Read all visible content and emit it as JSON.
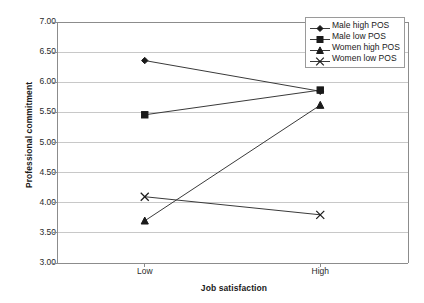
{
  "chart_data": {
    "type": "line",
    "title": "",
    "xlabel": "Job satisfaction",
    "ylabel": "Professional commitment",
    "categories": [
      "Low",
      "High"
    ],
    "ylim": [
      3.0,
      7.0
    ],
    "ytick_step": 0.5,
    "ytick_labels": [
      "7.00",
      "6.50",
      "6.00",
      "5.50",
      "5.00",
      "4.50",
      "4.00",
      "3.50",
      "3.00"
    ],
    "ytick_values": [
      7.0,
      6.5,
      6.0,
      5.5,
      5.0,
      4.5,
      4.0,
      3.5,
      3.0
    ],
    "grid": "horizontal",
    "legend_position": "top-right-inside",
    "series": [
      {
        "name": "Male high POS",
        "marker": "diamond",
        "values": [
          6.36,
          5.85
        ]
      },
      {
        "name": "Male low POS",
        "marker": "square",
        "values": [
          5.46,
          5.87
        ]
      },
      {
        "name": "Women high POS",
        "marker": "triangle",
        "values": [
          3.7,
          5.62
        ]
      },
      {
        "name": "Women low POS",
        "marker": "cross",
        "values": [
          4.1,
          3.8
        ]
      }
    ],
    "colors": {
      "line": "#3a3a3a",
      "marker": "#1a1a1a",
      "grid": "#c8c8c8",
      "frame": "#8c8c8c",
      "background": "#ffffff"
    }
  },
  "legend": {
    "items": [
      {
        "label": "Male high POS"
      },
      {
        "label": "Male low POS"
      },
      {
        "label": "Women high POS"
      },
      {
        "label": "Women low POS"
      }
    ]
  },
  "axes": {
    "y_title": "Professional commitment",
    "x_title": "Job satisfaction",
    "y_ticks": [
      {
        "label": "7.00"
      },
      {
        "label": "6.50"
      },
      {
        "label": "6.00"
      },
      {
        "label": "5.50"
      },
      {
        "label": "5.00"
      },
      {
        "label": "4.50"
      },
      {
        "label": "4.00"
      },
      {
        "label": "3.50"
      },
      {
        "label": "3.00"
      }
    ],
    "x_ticks": [
      {
        "label": "Low"
      },
      {
        "label": "High"
      }
    ]
  }
}
